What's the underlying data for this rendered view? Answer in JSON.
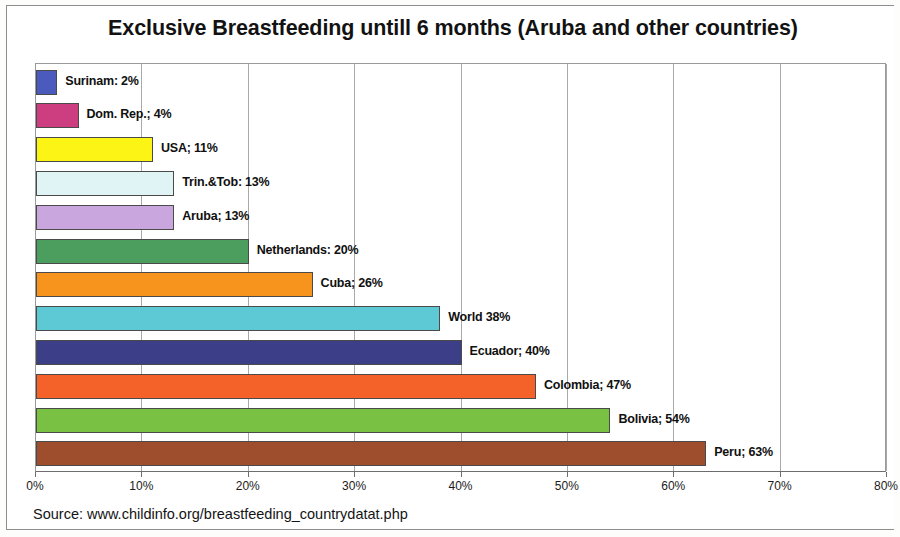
{
  "title": "Exclusive Breastfeeding untill 6 months (Aruba and other countries)",
  "source": "Source: www.childinfo.org/breastfeeding_countrydatat.php",
  "chart_data": {
    "type": "bar",
    "orientation": "horizontal",
    "title": "Exclusive Breastfeeding untill 6 months (Aruba and other countries)",
    "xlabel": "",
    "ylabel": "",
    "xlim": [
      0,
      80
    ],
    "grid": true,
    "legend": "none",
    "tick_labels": [
      "0%",
      "10%",
      "20%",
      "30%",
      "40%",
      "50%",
      "60%",
      "70%",
      "80%"
    ],
    "tick_values": [
      0,
      10,
      20,
      30,
      40,
      50,
      60,
      70,
      80
    ],
    "categories": [
      "Surinam",
      "Dom. Rep.",
      "USA",
      "Trin.&Tob",
      "Aruba",
      "Netherlands",
      "Cuba",
      "World",
      "Ecuador",
      "Colombia",
      "Bolivia",
      "Peru"
    ],
    "values": [
      2,
      4,
      11,
      13,
      13,
      20,
      26,
      38,
      40,
      47,
      54,
      63
    ],
    "data_labels": [
      "Surinam: 2%",
      "Dom. Rep.; 4%",
      "USA; 11%",
      "Trin.&Tob: 13%",
      "Aruba; 13%",
      "Netherlands: 20%",
      "Cuba; 26%",
      "World 38%",
      "Ecuador; 40%",
      "Colombia; 47%",
      "Bolivia; 54%",
      "Peru; 63%"
    ],
    "colors": [
      "#4a5bbd",
      "#cc3e7f",
      "#fbf414",
      "#e0f4f5",
      "#c9a7de",
      "#4b9e5e",
      "#f7941e",
      "#5cc9d4",
      "#3c3f87",
      "#f4622a",
      "#79c143",
      "#9e4e2c"
    ]
  }
}
